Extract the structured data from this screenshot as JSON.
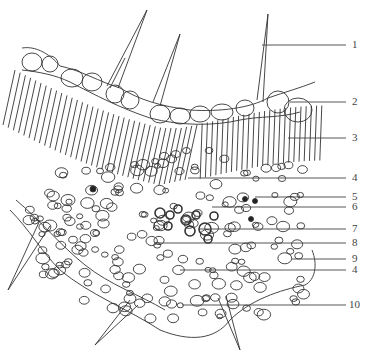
{
  "diagram": {
    "stroke_color": "#333333",
    "background": "#ffffff",
    "labels": [
      {
        "text": "1",
        "y": 45,
        "line_from_x": 262,
        "target": "trichome"
      },
      {
        "text": "2",
        "y": 102,
        "line_from_x": 290,
        "target": "upper epidermis"
      },
      {
        "text": "3",
        "y": 138,
        "line_from_x": 288,
        "target": "palisade mesophyll"
      },
      {
        "text": "4",
        "y": 178,
        "line_from_x": 188,
        "target": "collenchyma/sclerenchyma (upper)"
      },
      {
        "text": "5",
        "y": 197,
        "line_from_x": 255,
        "target": "crystal cell"
      },
      {
        "text": "6",
        "y": 207,
        "line_from_x": 212,
        "target": "spongy mesophyll"
      },
      {
        "text": "7",
        "y": 229,
        "line_from_x": 200,
        "target": "xylem"
      },
      {
        "text": "8",
        "y": 243,
        "line_from_x": 155,
        "target": "phloem"
      },
      {
        "text": "9",
        "y": 259,
        "line_from_x": 292,
        "target": "lower epidermis"
      },
      {
        "text": "4",
        "y": 270,
        "line_from_x": 180,
        "target": "collenchyma/sclerenchyma (lower)"
      },
      {
        "text": "10",
        "y": 305,
        "line_from_x": 182,
        "target": "parenchyma"
      }
    ]
  }
}
